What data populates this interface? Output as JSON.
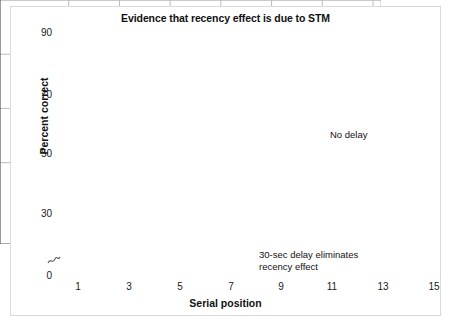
{
  "chart": {
    "title": "Evidence that recency effect is due to STM",
    "xlabel": "Serial position",
    "ylabel": "Percent correct"
  },
  "axis": {
    "y_ticks": [
      "0",
      "30",
      "50",
      "70",
      "90"
    ],
    "x_ticks": [
      "1",
      "3",
      "5",
      "7",
      "9",
      "11",
      "13",
      "15"
    ],
    "break_symbol": "axis-break"
  },
  "annotations": {
    "no_delay": "No delay",
    "delay": "30-sec delay eliminates\nrecency effect"
  },
  "colors": {
    "solid_line": "#3a3a3a",
    "dashed_line": "#6e6e6e",
    "marker_fill": "#7a7a7a",
    "grid": "#b4b4b4",
    "axis": "#555555",
    "text": "#111111",
    "frame": "#d9d9d9"
  },
  "chart_data": {
    "type": "line",
    "title": "Evidence that recency effect is due to STM",
    "xlabel": "Serial position",
    "ylabel": "Percent correct",
    "xlim": [
      0,
      16
    ],
    "ylim": [
      0,
      90
    ],
    "ytick_values": [
      0,
      30,
      50,
      70,
      90
    ],
    "xtick_values": [
      1,
      3,
      5,
      7,
      9,
      11,
      13,
      15
    ],
    "grid": true,
    "axis_break_near_zero": true,
    "legend": "annotations",
    "x": [
      1,
      2,
      3,
      4,
      5,
      6,
      7,
      8,
      9,
      10,
      11,
      12,
      13,
      14,
      15
    ],
    "series": [
      {
        "name": "No delay",
        "marker": "filled-circle",
        "linestyle": "solid",
        "values": [
          70,
          55,
          41,
          32,
          25,
          27,
          17,
          25,
          36,
          16,
          32,
          29,
          44,
          51,
          60
        ]
      },
      {
        "name": "30-sec delay eliminates recency effect",
        "marker": "open-triangle",
        "linestyle": "dashed",
        "values": [
          63,
          45,
          28,
          31,
          22,
          19,
          8,
          22,
          29,
          18,
          24,
          24,
          25,
          25,
          18
        ]
      }
    ]
  }
}
